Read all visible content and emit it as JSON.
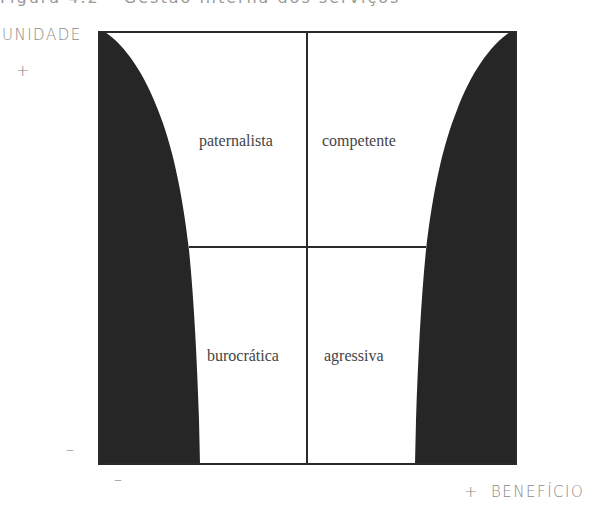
{
  "figure": {
    "title_clipped": "Figura 4.2 – Gestão interna dos serviços",
    "y_axis": {
      "label": "UNIDADE",
      "plus": "+",
      "minus": "–"
    },
    "x_axis": {
      "label": "BENEFÍCIO",
      "plus": "+",
      "minus": "–"
    },
    "quadrants": {
      "top_left": "paternalista",
      "top_right": "competente",
      "bottom_left": "burocrática",
      "bottom_right": "agressiva"
    },
    "colors": {
      "frame": "#2b2b2b",
      "shading": "#262626",
      "text": "#444444",
      "axis_text": "#8a8a8a"
    }
  }
}
